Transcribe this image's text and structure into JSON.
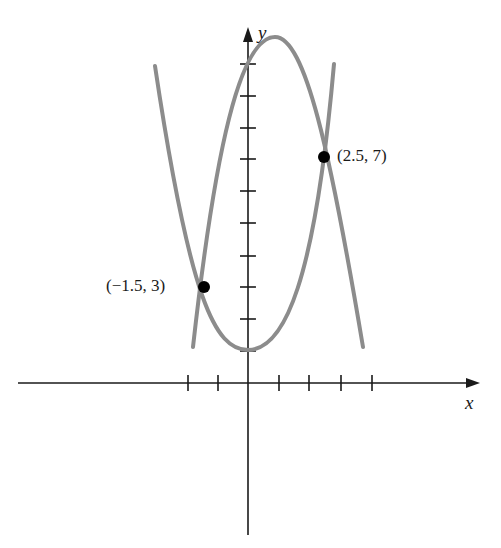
{
  "figure": {
    "axes": {
      "x_label": "x",
      "y_label": "y",
      "x_ticks": [
        -2,
        -1,
        1,
        2,
        3,
        4
      ],
      "y_ticks": [
        1,
        2,
        3,
        4,
        5,
        6,
        7,
        8,
        9,
        10
      ]
    },
    "curves": [
      {
        "name": "upward-parabola",
        "description": "opens upward, vertex at (0, 1)",
        "color": "#8c8c8c"
      },
      {
        "name": "downward-parabola",
        "description": "opens downward, vertex near (1, 10.8)",
        "color": "#8c8c8c"
      }
    ],
    "intersection_points": [
      {
        "label": "(−1.5, 3)",
        "x": -1.5,
        "y": 3
      },
      {
        "label": "(2.5, 7)",
        "x": 2.5,
        "y": 7
      }
    ],
    "colors": {
      "axis": "#1a1a1a",
      "curve": "#8c8c8c",
      "point": "#000000",
      "background": "#ffffff"
    }
  }
}
